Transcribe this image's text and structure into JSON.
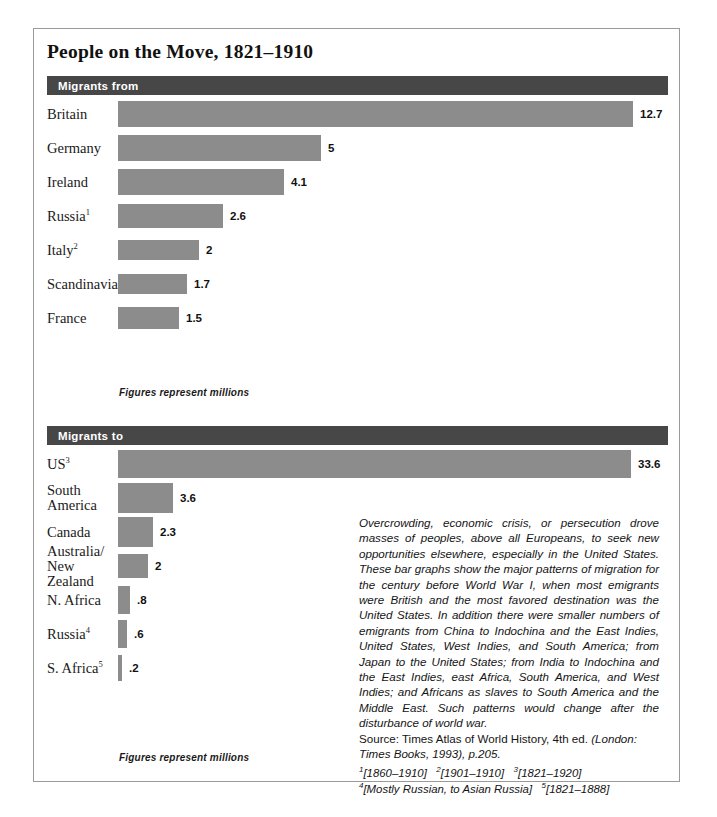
{
  "figure": {
    "title": "People on the Move, 1821–1910"
  },
  "chart_data": [
    {
      "type": "bar",
      "title": "Migrants from",
      "orientation": "horizontal",
      "unit": "millions",
      "caption": "Figures represent millions",
      "categories": [
        "Britain",
        "Germany",
        "Ireland",
        "Russia",
        "Italy",
        "Scandinavia",
        "France"
      ],
      "values": [
        12.7,
        5,
        4.1,
        2.6,
        2,
        1.7,
        1.5
      ],
      "value_labels": [
        "12.7",
        "5",
        "4.1",
        "2.6",
        "2",
        "1.7",
        "1.5"
      ],
      "footnote_markers": [
        "",
        "",
        "",
        "1",
        "2",
        "",
        ""
      ],
      "xlabel": "",
      "ylabel": "",
      "xlim": [
        0,
        12.7
      ],
      "grid": false,
      "legend": "none"
    },
    {
      "type": "bar",
      "title": "Migrants to",
      "orientation": "horizontal",
      "unit": "millions",
      "caption": "Figures represent millions",
      "categories": [
        "US",
        "South\nAmerica",
        "Canada",
        "Australia/\nNew Zealand",
        "N. Africa",
        "Russia",
        "S. Africa"
      ],
      "values": [
        33.6,
        3.6,
        2.3,
        2,
        0.8,
        0.6,
        0.2
      ],
      "value_labels": [
        "33.6",
        "3.6",
        "2.3",
        "2",
        ".8",
        ".6",
        ".2"
      ],
      "footnote_markers": [
        "3",
        "",
        "",
        "",
        "",
        "4",
        "5"
      ],
      "xlabel": "",
      "ylabel": "",
      "xlim": [
        0,
        33.6
      ],
      "grid": false,
      "legend": "none"
    }
  ],
  "note": {
    "body": "Overcrowding, economic crisis, or persecution drove masses of peoples, above all Europeans, to seek new opportunities elsewhere, especially in the United States. These bar graphs show the major patterns of migration for the century before World War I, when most emigrants were British and the most favored destination was the United States. In addition there were smaller numbers of emigrants from China to Indochina and the East Indies, United States, West Indies, and South America; from Japan to the United States; from India to Indochina and the East Indies, east Africa, South America, and West Indies; and Africans as slaves to South America and the Middle East. Such patterns would change after the disturbance of world war.",
    "source_prefix": "Source: Times Atlas of World History, 4th ed. ",
    "source_italic": "(London: Times Books, 1993), p.205.",
    "footnote_line_1": "[1860–1910]   [1901–1910]   [1821–1920]",
    "footnote_line_2": "[Mostly Russian, to Asian Russia]   [1821–1888]",
    "footnote_markers_line_1": [
      "1",
      "2",
      "3"
    ],
    "footnote_markers_line_2": [
      "4",
      "5"
    ]
  },
  "colors": {
    "bar_fill": "#8c8c8c",
    "section_header": "#474747",
    "frame_border": "#9a9a9a",
    "text": "#141414",
    "background": "#ffffff"
  },
  "layout": {
    "chart_from_rows_top": 80,
    "chart_to_rows_top": 430,
    "row_height": 34,
    "bar_origin_x": 84,
    "scale_from_px_per_million": 40.5,
    "scale_to_px_per_million_large": 15.3,
    "scale_to_px_per_million_small": 16.2
  }
}
